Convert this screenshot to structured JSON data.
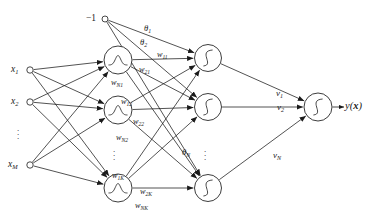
{
  "figure": {
    "top_artifact_text": "·· ···· ·· ·· ··· ···· ·· ·· ··· ···",
    "stroke_color": "#1a1a1a",
    "background_color": "#ffffff",
    "node_fill": "#ffffff"
  },
  "bias": {
    "label": "−1",
    "name": "bias-node"
  },
  "input_layer": {
    "name": "input-layer",
    "nodes": [
      {
        "label": "x",
        "sub": "1",
        "cx": 30,
        "cy": 70
      },
      {
        "label": "x",
        "sub": "2",
        "cx": 30,
        "cy": 102
      },
      {
        "label": "x",
        "sub": "M",
        "cx": 30,
        "cy": 165
      }
    ],
    "ellipsis": "⋮"
  },
  "hidden_layer": {
    "name": "rbf-hidden-layer",
    "activation": "gaussian",
    "nodes": [
      {
        "cx": 118,
        "cy": 60
      },
      {
        "cx": 118,
        "cy": 110
      },
      {
        "cx": 118,
        "cy": 188
      }
    ],
    "ellipsis": "⋮"
  },
  "sigmoid_layer": {
    "name": "sigmoid-hidden-layer",
    "activation": "sigmoid",
    "nodes": [
      {
        "cx": 208,
        "cy": 58
      },
      {
        "cx": 208,
        "cy": 107
      },
      {
        "cx": 208,
        "cy": 188
      }
    ],
    "ellipsis": "⋮"
  },
  "output_layer": {
    "name": "output-layer",
    "activation": "sigmoid",
    "node": {
      "cx": 318,
      "cy": 107
    },
    "label": "y(",
    "label_var": "x",
    "label_close": ")"
  },
  "theta_labels": [
    {
      "base": "θ",
      "sub": "1",
      "x": 144,
      "y": 24
    },
    {
      "base": "θ",
      "sub": "2",
      "x": 140,
      "y": 38
    },
    {
      "base": "θ",
      "sub": "N",
      "x": 182,
      "y": 148
    }
  ],
  "weight_labels": [
    {
      "base": "w",
      "sub": "11",
      "x": 157,
      "y": 51
    },
    {
      "base": "w",
      "sub": "21",
      "x": 139,
      "y": 66
    },
    {
      "base": "w",
      "sub": "N1",
      "x": 111,
      "y": 79
    },
    {
      "base": "w",
      "sub": "12",
      "x": 121,
      "y": 98
    },
    {
      "base": "w",
      "sub": "22",
      "x": 133,
      "y": 118
    },
    {
      "base": "w",
      "sub": "N2",
      "x": 116,
      "y": 134
    },
    {
      "base": "w",
      "sub": "1K",
      "x": 112,
      "y": 172
    },
    {
      "base": "w",
      "sub": "2K",
      "x": 140,
      "y": 188
    },
    {
      "base": "w",
      "sub": "NK",
      "x": 135,
      "y": 202
    }
  ],
  "output_weight_labels": [
    {
      "base": "v",
      "sub": "1",
      "x": 276,
      "y": 89
    },
    {
      "base": "v",
      "sub": "2",
      "x": 277,
      "y": 103
    },
    {
      "base": "v",
      "sub": "N",
      "x": 273,
      "y": 151
    }
  ]
}
